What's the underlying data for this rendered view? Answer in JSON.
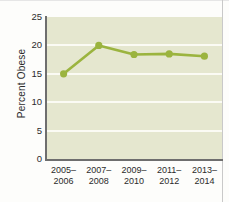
{
  "chart_data": {
    "type": "line",
    "title": "",
    "xlabel": "",
    "ylabel": "Percent Obese",
    "categories": [
      "2005–2006",
      "2007–2008",
      "2009–2010",
      "2011–2012",
      "2013–2014"
    ],
    "category_lines": [
      [
        "2005–",
        "2006"
      ],
      [
        "2007–",
        "2008"
      ],
      [
        "2009–",
        "2010"
      ],
      [
        "2011–",
        "2012"
      ],
      [
        "2013–",
        "2014"
      ]
    ],
    "values": [
      15.0,
      20.0,
      18.4,
      18.5,
      18.1
    ],
    "ylim": [
      0,
      25
    ],
    "yticks": [
      0,
      5,
      10,
      15,
      20,
      25
    ],
    "ytick_labels": [
      "0",
      "5",
      "10",
      "15",
      "20",
      "25"
    ],
    "grid": "horizontal",
    "legend": "none",
    "series_color": "#9bb43f",
    "marker_color": "#9bb43f",
    "plot_background": "#e5e7cf",
    "gridline_color": "#fbfbf4",
    "axis_color": "#6e6e6e",
    "text_color": "#2b2b2b"
  }
}
